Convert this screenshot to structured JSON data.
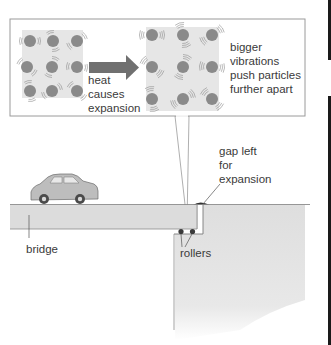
{
  "inset": {
    "arrow_label": [
      "heat",
      "causes",
      "expansion"
    ],
    "description": [
      "bigger",
      "vibrations",
      "push particles",
      "further apart"
    ]
  },
  "labels": {
    "bridge": "bridge",
    "rollers": "rollers",
    "gap": [
      "gap left",
      "for",
      "expansion"
    ]
  },
  "colors": {
    "particle": "#8a8a8a",
    "particle_bg": "#e4e4e4",
    "arrow": "#6e6e6e",
    "bridge_fill": "#dcdcdc",
    "line": "#7a7a7a",
    "edge_bar": "#1a1a1a"
  },
  "left_particles": [
    [
      30,
      41
    ],
    [
      53,
      41
    ],
    [
      77,
      41
    ],
    [
      27,
      67
    ],
    [
      52,
      67
    ],
    [
      77,
      67
    ],
    [
      30,
      91
    ],
    [
      52,
      91
    ],
    [
      77,
      91
    ]
  ],
  "right_particles": [
    [
      152,
      35
    ],
    [
      183,
      35
    ],
    [
      212,
      35
    ],
    [
      152,
      67
    ],
    [
      183,
      67
    ],
    [
      212,
      67
    ],
    [
      152,
      99
    ],
    [
      183,
      99
    ],
    [
      212,
      99
    ]
  ]
}
